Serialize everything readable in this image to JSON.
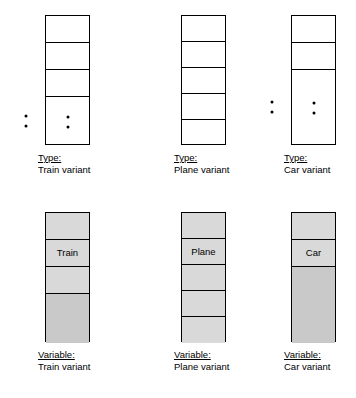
{
  "diagram": {
    "colors": {
      "outline": "#000000",
      "cell_empty": "#ffffff",
      "cell_filled": "#d9d9d9",
      "cell_filled_tail": "#c9c9c9"
    },
    "figures": [
      {
        "id": "type-train",
        "caption_kind": "Type:",
        "caption_name": "Train variant",
        "fields": [
          "Date",
          "Tag",
          "Time"
        ],
        "tail_label_dots": true,
        "cells": [
          {
            "label": "Date",
            "value": "",
            "fill": "empty",
            "dots": false
          },
          {
            "label": "Tag",
            "value": "",
            "fill": "empty",
            "dots": false
          },
          {
            "label": "Time",
            "value": "",
            "fill": "empty",
            "dots": false
          },
          {
            "label": "",
            "value": "",
            "fill": "empty",
            "dots": true
          }
        ]
      },
      {
        "id": "type-plane",
        "caption_kind": "Type:",
        "caption_name": "Plane variant",
        "fields": [
          "Date",
          "Tag",
          "Time",
          "FltNumber",
          "SeatNumber"
        ],
        "tail_label_dots": false,
        "cells": [
          {
            "label": "Date",
            "value": "",
            "fill": "empty",
            "dots": false
          },
          {
            "label": "Tag",
            "value": "",
            "fill": "empty",
            "dots": false
          },
          {
            "label": "Time",
            "value": "",
            "fill": "empty",
            "dots": false
          },
          {
            "label": "FltNumber",
            "value": "",
            "fill": "empty",
            "dots": false
          },
          {
            "label": "SeatNumber",
            "value": "",
            "fill": "empty",
            "dots": false
          }
        ]
      },
      {
        "id": "type-car",
        "caption_kind": "Type:",
        "caption_name": "Car variant",
        "fields": [
          "Date",
          "Tag"
        ],
        "tail_label_dots": true,
        "cells": [
          {
            "label": "Date",
            "value": "",
            "fill": "empty",
            "dots": false
          },
          {
            "label": "Tag",
            "value": "",
            "fill": "empty",
            "dots": false
          },
          {
            "label": "",
            "value": "",
            "fill": "empty",
            "dots": true
          }
        ]
      },
      {
        "id": "variable-train",
        "caption_kind": "Variable:",
        "caption_name": "Train variant",
        "fields": [
          "Date",
          "Tag",
          "Time"
        ],
        "tail_label_dots": false,
        "cells": [
          {
            "label": "Date",
            "value": "",
            "fill": "filled",
            "dots": false
          },
          {
            "label": "Tag",
            "value": "Train",
            "fill": "filled",
            "dots": false
          },
          {
            "label": "Time",
            "value": "",
            "fill": "filled",
            "dots": false
          },
          {
            "label": "",
            "value": "",
            "fill": "filled-dark",
            "dots": false
          }
        ]
      },
      {
        "id": "variable-plane",
        "caption_kind": "Variable:",
        "caption_name": "Plane variant",
        "fields": [
          "Date",
          "Tag",
          "Time",
          "FltNumber",
          "SeatNumber"
        ],
        "tail_label_dots": false,
        "cells": [
          {
            "label": "Date",
            "value": "",
            "fill": "filled",
            "dots": false
          },
          {
            "label": "Tag",
            "value": "Plane",
            "fill": "filled",
            "dots": false
          },
          {
            "label": "Time",
            "value": "",
            "fill": "filled",
            "dots": false
          },
          {
            "label": "FltNumber",
            "value": "",
            "fill": "filled",
            "dots": false
          },
          {
            "label": "SeatNumber",
            "value": "",
            "fill": "filled",
            "dots": false
          }
        ]
      },
      {
        "id": "variable-car",
        "caption_kind": "Variable:",
        "caption_name": "Car variant",
        "fields": [
          "Date",
          "Tag"
        ],
        "tail_label_dots": false,
        "cells": [
          {
            "label": "Date",
            "value": "",
            "fill": "filled",
            "dots": false
          },
          {
            "label": "Tag",
            "value": "Car",
            "fill": "filled",
            "dots": false
          },
          {
            "label": "",
            "value": "",
            "fill": "filled-dark",
            "dots": false
          }
        ]
      }
    ]
  }
}
